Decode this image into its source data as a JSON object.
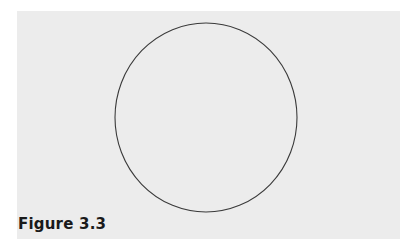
{
  "figure": {
    "caption": "Figure 3.3",
    "shape": "circle",
    "background_color": "#ececec",
    "stroke_color": "#3a3a3a",
    "circle": {
      "cx": 206,
      "cy": 117.5,
      "rx": 91,
      "ry": 94.5
    }
  }
}
